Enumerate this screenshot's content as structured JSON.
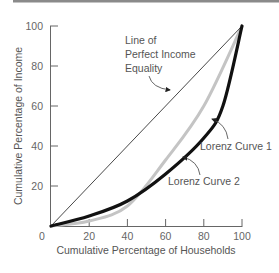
{
  "chart_data": {
    "type": "line",
    "title": "",
    "xlabel": "Cumulative Percentage of Households",
    "ylabel": "Cumulative Percentage of Income",
    "xlim": [
      0,
      100
    ],
    "ylim": [
      0,
      100
    ],
    "x_ticks": [
      20,
      40,
      60,
      80,
      100
    ],
    "y_ticks": [
      20,
      40,
      60,
      80,
      100
    ],
    "origin_label": "0",
    "grid": false,
    "legend": "none (inline annotations)",
    "series": [
      {
        "name": "Line of Perfect Income Equality",
        "color": "#333333",
        "x": [
          0,
          100
        ],
        "y": [
          0,
          100
        ]
      },
      {
        "name": "Lorenz Curve 1",
        "color": "#111111",
        "x": [
          0,
          20,
          40,
          60,
          80,
          90,
          100
        ],
        "y": [
          0,
          5,
          12.5,
          26,
          44,
          60,
          100
        ]
      },
      {
        "name": "Lorenz Curve 2",
        "color": "#c4c4c4",
        "x": [
          0,
          20,
          40,
          60,
          80,
          100
        ],
        "y": [
          0,
          2.5,
          10,
          33,
          60,
          100
        ]
      }
    ],
    "annotations": [
      {
        "text_lines": [
          "Line of",
          "Perfect Income",
          "Equality"
        ],
        "points_to": "Line of Perfect Income Equality"
      },
      {
        "text": "Lorenz Curve 1",
        "points_to": "Lorenz Curve 1"
      },
      {
        "text": "Lorenz Curve 2",
        "points_to": "Lorenz Curve 2"
      }
    ]
  }
}
